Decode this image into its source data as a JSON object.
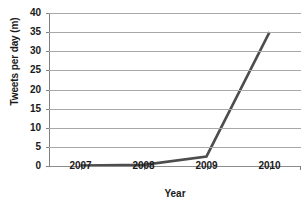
{
  "chart_data": {
    "type": "line",
    "title": "",
    "xlabel": "Year",
    "ylabel": "Tweets per day (m)",
    "xlim": [
      2006.5,
      2010.5
    ],
    "ylim": [
      0,
      40
    ],
    "ytick_labels": [
      "40",
      "35",
      "30",
      "25",
      "20",
      "15",
      "10",
      "5",
      "0"
    ],
    "ytick_values": [
      40,
      35,
      30,
      25,
      20,
      15,
      10,
      5,
      0
    ],
    "xtick_labels": [
      "2007",
      "2008",
      "2009",
      "2010"
    ],
    "xtick_values": [
      2007,
      2008,
      2009,
      2010
    ],
    "grid": "horizontal",
    "legend": "none",
    "series": [
      {
        "name": "Tweets per day",
        "color": "#4d4d4d",
        "x": [
          2007,
          2008,
          2009,
          2010
        ],
        "values": [
          0.1,
          0.3,
          2.5,
          35
        ]
      }
    ]
  },
  "style": {
    "line_color": "#4d4d4d",
    "grid_color": "#a8a8a8",
    "axis_color": "#808080",
    "text_color": "#1a1a1a",
    "background": "#ffffff"
  }
}
